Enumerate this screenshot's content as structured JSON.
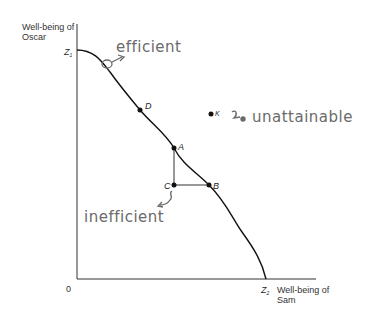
{
  "diagram": {
    "type": "utility-possibility-frontier",
    "y_axis_label_line1": "Well-being of",
    "y_axis_label_line2": "Oscar",
    "x_axis_label_line1": "Well-being of",
    "x_axis_label_line2": "Sam",
    "origin_label": "0",
    "z1_label": "Z",
    "z1_sub": "1",
    "z2_label": "Z",
    "z2_sub": "2",
    "points": {
      "D": "D",
      "A": "A",
      "B": "B",
      "C": "C",
      "K": "K"
    },
    "annotations": {
      "efficient": "efficient",
      "inefficient": "inefficient",
      "unattainable": "unattainable"
    },
    "colors": {
      "curve": "#111111",
      "axes": "#333333",
      "handwriting": "#6a6a6a"
    }
  }
}
